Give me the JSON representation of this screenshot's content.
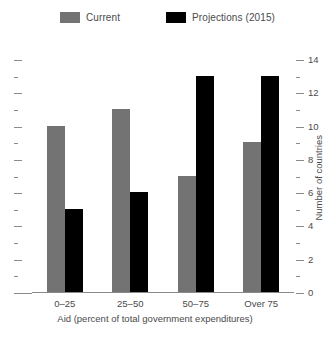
{
  "chart_data": {
    "type": "bar",
    "title": "",
    "categories": [
      "0–25",
      "25–50",
      "50–75",
      "Over 75"
    ],
    "series": [
      {
        "name": "Current",
        "color": "#737373",
        "values": [
          10,
          11,
          7,
          9
        ]
      },
      {
        "name": "Projections (2015)",
        "color": "#000000",
        "values": [
          5,
          6,
          13,
          13
        ]
      }
    ],
    "xlabel": "Aid (percent of total government expenditures)",
    "ylabel": "Number of countries",
    "ylim": [
      0,
      14
    ],
    "ytick_major": [
      0,
      2,
      4,
      6,
      8,
      10,
      12,
      14
    ],
    "ytick_major_labels": [
      "0",
      "2",
      "4",
      "6",
      "8",
      "10",
      "12",
      "14"
    ],
    "ytick_minor": [
      1,
      3,
      5,
      7,
      9,
      11,
      13
    ],
    "grid": false,
    "legend_position": "top-center",
    "y_axis_side": "right"
  }
}
